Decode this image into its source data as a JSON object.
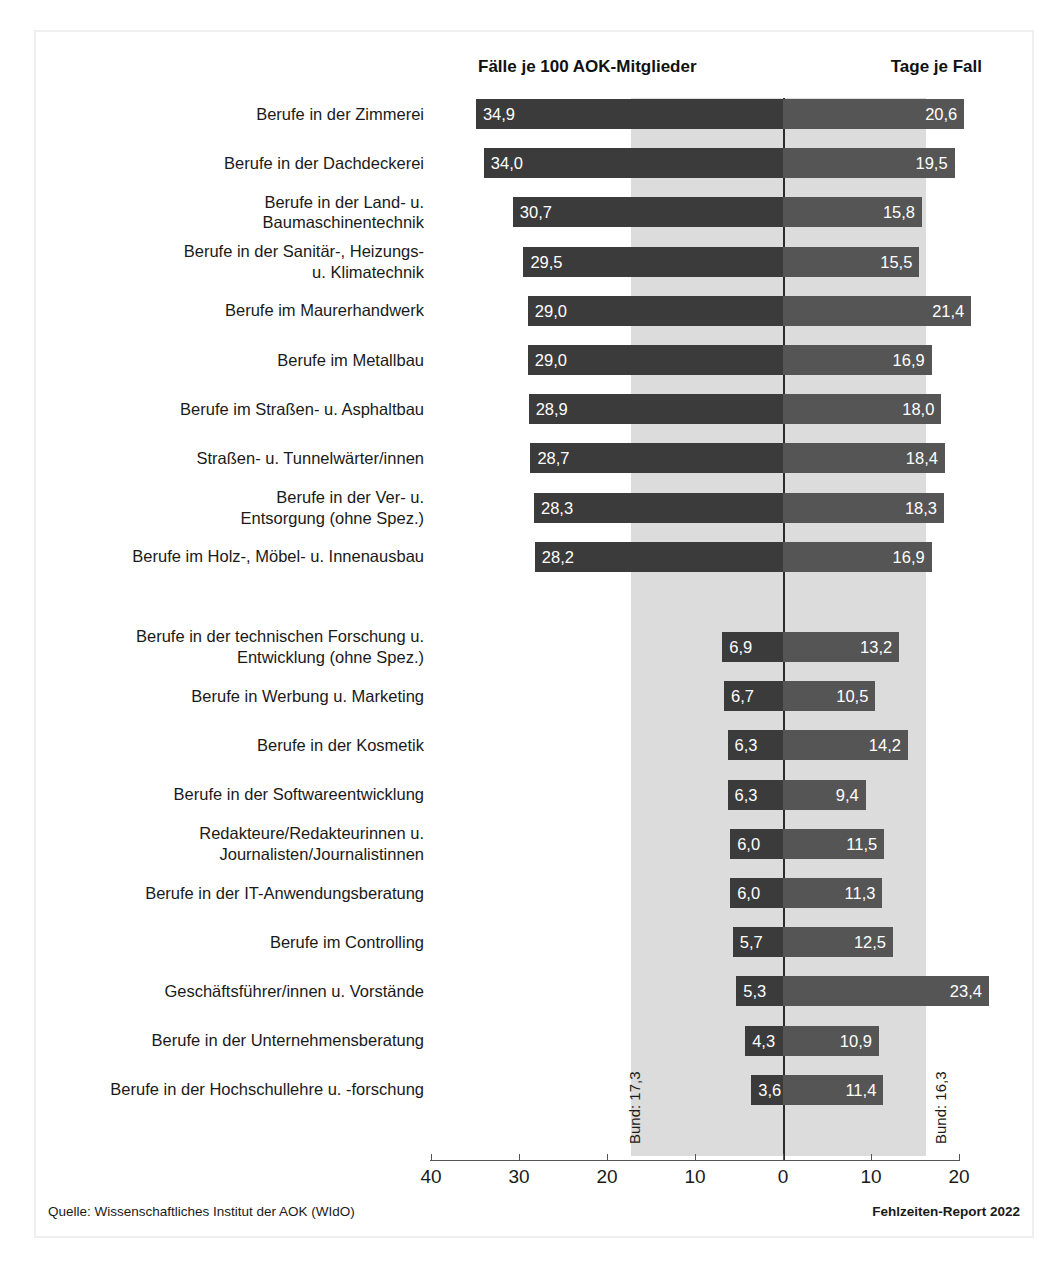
{
  "headers": {
    "left": "Fälle je 100 AOK-Mitglieder",
    "right": "Tage je Fall"
  },
  "reference": {
    "left_label": "Bund: 17,3",
    "right_label": "Bund: 16,3",
    "left_value": 17.3,
    "right_value": 16.3
  },
  "footer": {
    "source": "Quelle: Wissenschaftliches Institut der AOK (WIdO)",
    "report": "Fehlzeiten-Report 2022"
  },
  "colors": {
    "bar_left": "#3b3b3b",
    "bar_right": "#555555",
    "band": "#dcdcdc",
    "zero_line": "#2b2b2b",
    "frame": "#efefef"
  },
  "chart_data": {
    "type": "bar",
    "title": "",
    "subtitle": "",
    "orientation": "horizontal-diverging",
    "xlabel": "",
    "ylabel": "",
    "grid": false,
    "legend_position": "top",
    "axis": {
      "zero_position_units": 0,
      "left_max": 40,
      "right_max": 24,
      "tick_labels": [
        "40",
        "30",
        "20",
        "10",
        "0",
        "10",
        "20"
      ],
      "tick_values": [
        -40,
        -30,
        -20,
        -10,
        0,
        10,
        20
      ]
    },
    "series": [
      {
        "name": "Fälle je 100 AOK-Mitglieder",
        "side": "left"
      },
      {
        "name": "Tage je Fall",
        "side": "right"
      }
    ],
    "categories": [
      "Berufe in der Zimmerei",
      "Berufe in der Dachdeckerei",
      "Berufe in der Land- u. Baumaschinentechnik",
      "Berufe in der Sanitär-, Heizungs- u. Klimatechnik",
      "Berufe im Maurerhandwerk",
      "Berufe im Metallbau",
      "Berufe im Straßen- u. Asphaltbau",
      "Straßen- u. Tunnelwärter/innen",
      "Berufe in der Ver- u. Entsorgung (ohne Spez.)",
      "Berufe im Holz-, Möbel- u. Innenausbau",
      "Berufe in der technischen Forschung u. Entwicklung (ohne Spez.)",
      "Berufe in Werbung u. Marketing",
      "Berufe in der Kosmetik",
      "Berufe in der Softwareentwicklung",
      "Redakteure/Redakteurinnen u. Journalisten/Journalistinnen",
      "Berufe in der IT-Anwendungsberatung",
      "Berufe im Controlling",
      "Geschäftsführer/innen u. Vorstände",
      "Berufe in der Unternehmensberatung",
      "Berufe in der Hochschullehre u. -forschung"
    ],
    "faelle": [
      34.9,
      34.0,
      30.7,
      29.5,
      29.0,
      29.0,
      28.9,
      28.7,
      28.3,
      28.2,
      6.9,
      6.7,
      6.3,
      6.3,
      6.0,
      6.0,
      5.7,
      5.3,
      4.3,
      3.6
    ],
    "tage": [
      20.6,
      19.5,
      15.8,
      15.5,
      21.4,
      16.9,
      18.0,
      18.4,
      18.3,
      16.9,
      13.2,
      10.5,
      14.2,
      9.4,
      11.5,
      11.3,
      12.5,
      23.4,
      10.9,
      11.4
    ]
  },
  "rows": [
    {
      "label_lines": [
        "Berufe in der Zimmerei"
      ],
      "faelle": "34,9",
      "tage": "20,6"
    },
    {
      "label_lines": [
        "Berufe in der Dachdeckerei"
      ],
      "faelle": "34,0",
      "tage": "19,5"
    },
    {
      "label_lines": [
        "Berufe in der Land- u.",
        "Baumaschinentechnik"
      ],
      "faelle": "30,7",
      "tage": "15,8"
    },
    {
      "label_lines": [
        "Berufe in der Sanitär-, Heizungs-",
        "u. Klimatechnik"
      ],
      "faelle": "29,5",
      "tage": "15,5"
    },
    {
      "label_lines": [
        "Berufe im Maurerhandwerk"
      ],
      "faelle": "29,0",
      "tage": "21,4"
    },
    {
      "label_lines": [
        "Berufe im Metallbau"
      ],
      "faelle": "29,0",
      "tage": "16,9"
    },
    {
      "label_lines": [
        "Berufe im Straßen- u. Asphaltbau"
      ],
      "faelle": "28,9",
      "tage": "18,0"
    },
    {
      "label_lines": [
        "Straßen- u. Tunnelwärter/innen"
      ],
      "faelle": "28,7",
      "tage": "18,4"
    },
    {
      "label_lines": [
        "Berufe in der Ver- u.",
        "Entsorgung (ohne Spez.)"
      ],
      "faelle": "28,3",
      "tage": "18,3"
    },
    {
      "label_lines": [
        "Berufe im Holz-, Möbel- u. Innenausbau"
      ],
      "faelle": "28,2",
      "tage": "16,9"
    },
    {
      "label_lines": [
        "Berufe in der technischen Forschung u.",
        "Entwicklung (ohne Spez.)"
      ],
      "faelle": "6,9",
      "tage": "13,2"
    },
    {
      "label_lines": [
        "Berufe in Werbung u. Marketing"
      ],
      "faelle": "6,7",
      "tage": "10,5"
    },
    {
      "label_lines": [
        "Berufe in der Kosmetik"
      ],
      "faelle": "6,3",
      "tage": "14,2"
    },
    {
      "label_lines": [
        "Berufe in der Softwareentwicklung"
      ],
      "faelle": "6,3",
      "tage": "9,4"
    },
    {
      "label_lines": [
        "Redakteure/Redakteurinnen u.",
        "Journalisten/Journalistinnen"
      ],
      "faelle": "6,0",
      "tage": "11,5"
    },
    {
      "label_lines": [
        "Berufe in der IT-Anwendungsberatung"
      ],
      "faelle": "6,0",
      "tage": "11,3"
    },
    {
      "label_lines": [
        "Berufe im Controlling"
      ],
      "faelle": "5,7",
      "tage": "12,5"
    },
    {
      "label_lines": [
        "Geschäftsführer/innen u. Vorstände"
      ],
      "faelle": "5,3",
      "tage": "23,4"
    },
    {
      "label_lines": [
        "Berufe in der Unternehmensberatung"
      ],
      "faelle": "4,3",
      "tage": "10,9"
    },
    {
      "label_lines": [
        "Berufe in der Hochschullehre u. -forschung"
      ],
      "faelle": "3,6",
      "tage": "11,4"
    }
  ],
  "axis_ticks": [
    {
      "label": "40",
      "value": -40
    },
    {
      "label": "30",
      "value": -30
    },
    {
      "label": "20",
      "value": -20
    },
    {
      "label": "10",
      "value": -10
    },
    {
      "label": "0",
      "value": 0
    },
    {
      "label": "10",
      "value": 10
    },
    {
      "label": "20",
      "value": 20
    }
  ]
}
